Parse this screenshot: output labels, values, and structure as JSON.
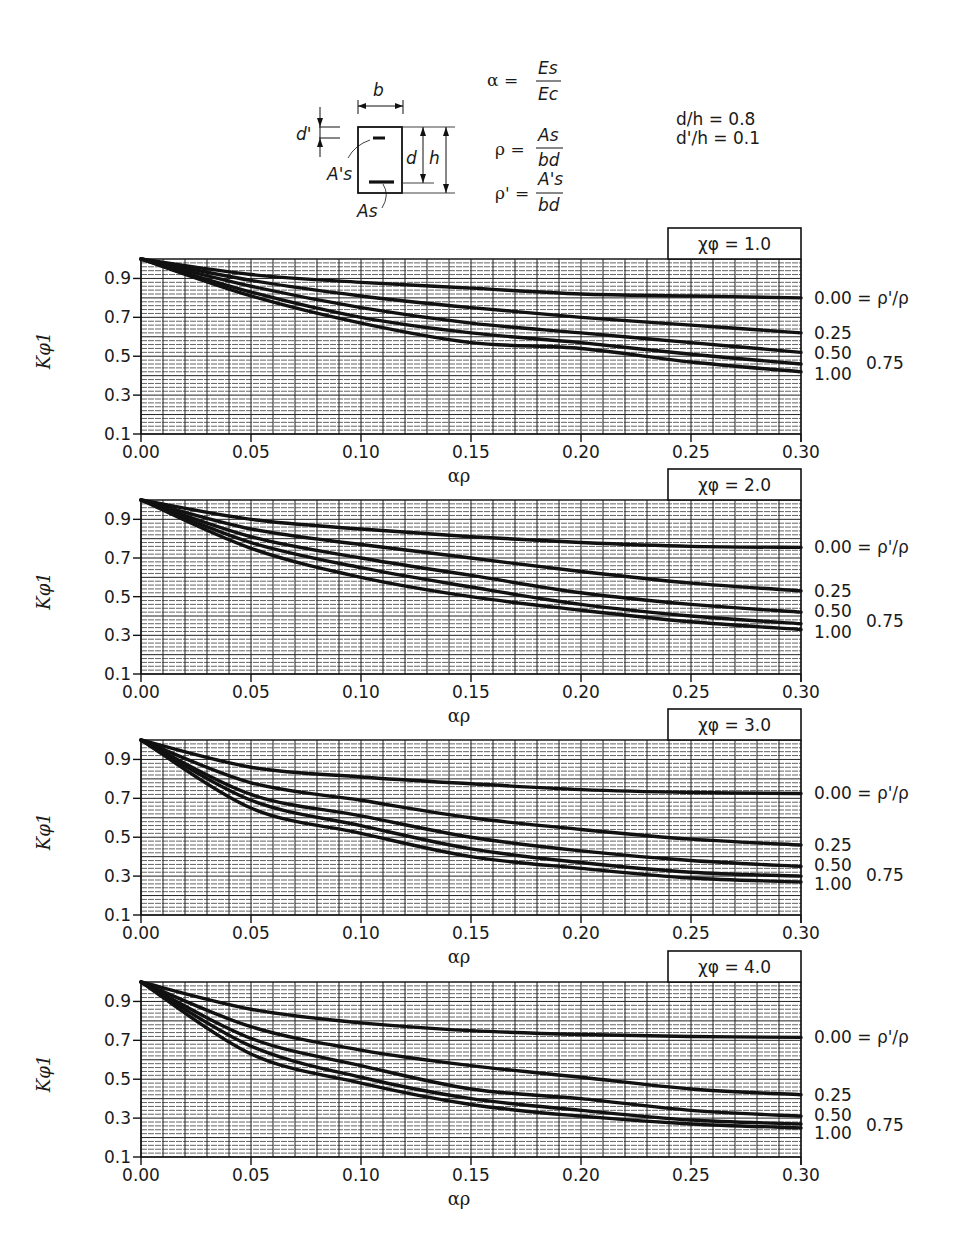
{
  "header": {
    "section_labels": {
      "b": "b",
      "d_prime": "d'",
      "d": "d",
      "h": "h",
      "As_prime": "A's",
      "As": "As"
    },
    "formulas": {
      "alpha": {
        "lhs": "α =",
        "num": "Es",
        "den": "Ec"
      },
      "rho": {
        "lhs": "ρ =",
        "num": "As",
        "den": "bd"
      },
      "rho_prime": {
        "lhs": "ρ' =",
        "num": "A's",
        "den": "bd"
      }
    },
    "ratios": {
      "d_over_h": "d/h = 0.8",
      "dprime_over_h": "d'/h = 0.1"
    }
  },
  "chart_data": [
    {
      "type": "line",
      "title": "χφ = 1.0",
      "xlabel": "αρ",
      "ylabel": "Kφ1",
      "xlim": [
        0.0,
        0.3
      ],
      "ylim": [
        0.1,
        1.0
      ],
      "xticks": [
        "0.00",
        "0.05",
        "0.10",
        "0.15",
        "0.20",
        "0.25",
        "0.30"
      ],
      "yticks": [
        "0.1",
        "0.3",
        "0.5",
        "0.7",
        "0.9"
      ],
      "grid": true,
      "x": [
        0.0,
        0.05,
        0.1,
        0.15,
        0.2,
        0.25,
        0.3
      ],
      "series": [
        {
          "name": "ρ'/ρ = 0.00",
          "values": [
            1.0,
            0.92,
            0.88,
            0.85,
            0.82,
            0.81,
            0.8
          ]
        },
        {
          "name": "ρ'/ρ = 0.25",
          "values": [
            1.0,
            0.89,
            0.81,
            0.75,
            0.7,
            0.66,
            0.62
          ]
        },
        {
          "name": "ρ'/ρ = 0.50",
          "values": [
            1.0,
            0.86,
            0.75,
            0.67,
            0.62,
            0.57,
            0.52
          ]
        },
        {
          "name": "ρ'/ρ = 0.75",
          "values": [
            1.0,
            0.83,
            0.7,
            0.62,
            0.57,
            0.51,
            0.46
          ]
        },
        {
          "name": "ρ'/ρ = 1.00",
          "values": [
            1.0,
            0.81,
            0.67,
            0.57,
            0.54,
            0.47,
            0.42
          ]
        }
      ]
    },
    {
      "type": "line",
      "title": "χφ = 2.0",
      "xlabel": "αρ",
      "ylabel": "Kφ1",
      "xlim": [
        0.0,
        0.3
      ],
      "ylim": [
        0.1,
        1.0
      ],
      "xticks": [
        "0.00",
        "0.05",
        "0.10",
        "0.15",
        "0.20",
        "0.25",
        "0.30"
      ],
      "yticks": [
        "0.1",
        "0.3",
        "0.5",
        "0.7",
        "0.9"
      ],
      "grid": true,
      "x": [
        0.0,
        0.05,
        0.1,
        0.15,
        0.2,
        0.25,
        0.3
      ],
      "series": [
        {
          "name": "ρ'/ρ = 0.00",
          "values": [
            1.0,
            0.9,
            0.85,
            0.81,
            0.78,
            0.76,
            0.755
          ]
        },
        {
          "name": "ρ'/ρ = 0.25",
          "values": [
            1.0,
            0.85,
            0.77,
            0.7,
            0.63,
            0.57,
            0.53
          ]
        },
        {
          "name": "ρ'/ρ = 0.50",
          "values": [
            1.0,
            0.81,
            0.7,
            0.61,
            0.52,
            0.46,
            0.42
          ]
        },
        {
          "name": "ρ'/ρ = 0.75",
          "values": [
            1.0,
            0.78,
            0.65,
            0.55,
            0.46,
            0.4,
            0.36
          ]
        },
        {
          "name": "ρ'/ρ = 1.00",
          "values": [
            1.0,
            0.75,
            0.6,
            0.5,
            0.43,
            0.37,
            0.33
          ]
        }
      ]
    },
    {
      "type": "line",
      "title": "χφ = 3.0",
      "xlabel": "αρ",
      "ylabel": "Kφ1",
      "xlim": [
        0.0,
        0.3
      ],
      "ylim": [
        0.1,
        1.0
      ],
      "xticks": [
        "0.00",
        "0.05",
        "0.10",
        "0.15",
        "0.20",
        "0.25",
        "0.30"
      ],
      "yticks": [
        "0.1",
        "0.3",
        "0.5",
        "0.7",
        "0.9"
      ],
      "grid": true,
      "x": [
        0.0,
        0.05,
        0.1,
        0.15,
        0.2,
        0.25,
        0.3
      ],
      "series": [
        {
          "name": "ρ'/ρ = 0.00",
          "values": [
            1.0,
            0.86,
            0.81,
            0.775,
            0.745,
            0.73,
            0.725
          ]
        },
        {
          "name": "ρ'/ρ = 0.25",
          "values": [
            1.0,
            0.78,
            0.69,
            0.6,
            0.54,
            0.49,
            0.46
          ]
        },
        {
          "name": "ρ'/ρ = 0.50",
          "values": [
            1.0,
            0.72,
            0.61,
            0.5,
            0.43,
            0.38,
            0.35
          ]
        },
        {
          "name": "ρ'/ρ = 0.75",
          "values": [
            1.0,
            0.69,
            0.56,
            0.44,
            0.37,
            0.32,
            0.3
          ]
        },
        {
          "name": "ρ'/ρ = 1.00",
          "values": [
            1.0,
            0.65,
            0.52,
            0.4,
            0.34,
            0.29,
            0.27
          ]
        }
      ]
    },
    {
      "type": "line",
      "title": "χφ = 4.0",
      "xlabel": "αρ",
      "ylabel": "Kφ1",
      "xlim": [
        0.0,
        0.3
      ],
      "ylim": [
        0.1,
        1.0
      ],
      "xticks": [
        "0.00",
        "0.05",
        "0.10",
        "0.15",
        "0.20",
        "0.25",
        "0.30"
      ],
      "yticks": [
        "0.1",
        "0.3",
        "0.5",
        "0.7",
        "0.9"
      ],
      "grid": true,
      "x": [
        0.0,
        0.05,
        0.1,
        0.15,
        0.2,
        0.25,
        0.3
      ],
      "series": [
        {
          "name": "ρ'/ρ = 0.00",
          "values": [
            1.0,
            0.86,
            0.79,
            0.75,
            0.73,
            0.72,
            0.715
          ]
        },
        {
          "name": "ρ'/ρ = 0.25",
          "values": [
            1.0,
            0.77,
            0.65,
            0.57,
            0.51,
            0.45,
            0.42
          ]
        },
        {
          "name": "ρ'/ρ = 0.50",
          "values": [
            1.0,
            0.71,
            0.57,
            0.45,
            0.4,
            0.34,
            0.31
          ]
        },
        {
          "name": "ρ'/ρ = 0.75",
          "values": [
            1.0,
            0.67,
            0.51,
            0.4,
            0.34,
            0.29,
            0.27
          ]
        },
        {
          "name": "ρ'/ρ = 1.00",
          "values": [
            1.0,
            0.63,
            0.48,
            0.37,
            0.31,
            0.27,
            0.25
          ]
        }
      ]
    }
  ],
  "series_labels": {
    "s0": "0.00 = ρ'/ρ",
    "s1": "0.25",
    "s2": "0.50",
    "s3": "0.75",
    "s4": "1.00"
  },
  "colors": {
    "ink": "#111111",
    "grid": "#222222",
    "background": "#ffffff"
  }
}
